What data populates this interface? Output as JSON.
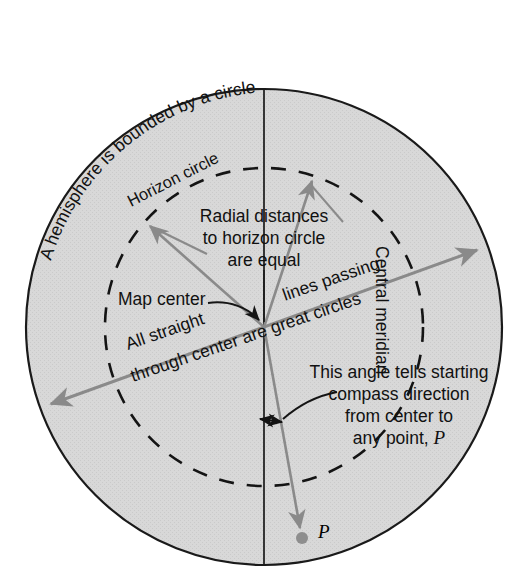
{
  "figure": {
    "title_text": "A hemisphere is bounded by a circle",
    "type": "azimuthal-equidistant-projection-diagram"
  },
  "labels": {
    "outer_circle": "A hemisphere is bounded by a circle",
    "horizon_circle": "Horizon circle",
    "radial_line_1": "Radial distances",
    "radial_line_2": "to horizon circle",
    "radial_line_3": "are equal",
    "map_center": "Map center",
    "great_circle_1": "All straight",
    "great_circle_2": "lines passing",
    "great_circle_3": "through center are great circles",
    "central_meridian": "Central meridian",
    "angle_line_1": "This angle tells starting",
    "angle_line_2": "compass direction",
    "angle_line_3": "from center to",
    "angle_line_4": "any point, ",
    "angle_line_4_italic": "P",
    "point_p": "P"
  },
  "geometry": {
    "center_x": 264,
    "center_y": 327,
    "outer_radius": 238,
    "horizon_radius": 159,
    "great_circle_angle_deg": -18,
    "p_point_x": 302,
    "p_point_y": 538
  },
  "colors": {
    "background": "#ffffff",
    "hemisphere_fill": "#d6d6d6",
    "outer_stroke": "#1a1a1a",
    "dashed_stroke": "#141414",
    "arrow_gray": "#8a8a8a",
    "meridian_stroke": "#1a1a1a",
    "text": "#111111",
    "point_fill": "#8e8e8e"
  }
}
